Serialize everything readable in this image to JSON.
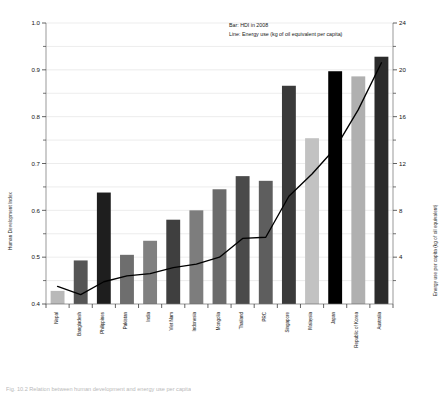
{
  "legend": {
    "bar_entry": "Bar:   HDI in 2008",
    "line_entry": "Line:  Energy use (kg of oil equivalent per capita)"
  },
  "axes": {
    "left_title": "Human Development Index",
    "right_title": "Energy use per capita (kg of oil equivalent)",
    "left_ticks": [
      "1.0",
      "0.9",
      "0.8",
      "0.7",
      "0.6",
      "0.5",
      "0.4"
    ],
    "right_ticks": [
      "24",
      "20",
      "16",
      "12",
      "8",
      "4"
    ]
  },
  "caption": {
    "text": "Fig. 10.2  Relation between human development and energy use per capita"
  },
  "chart_data": {
    "type": "bar",
    "title": "",
    "xlabel": "",
    "ylabel": "Human Development Index",
    "ylim": [
      0.4,
      1.0
    ],
    "y2label": "Energy use per capita (kg of oil equivalent)",
    "y2lim": [
      0,
      24
    ],
    "grid": true,
    "legend_position": "top-center",
    "categories": [
      "Nepal",
      "Bangladesh",
      "Philippines",
      "Pakistan",
      "India",
      "Viet Nam",
      "Indonesia",
      "Mongolia",
      "Thailand",
      "PRC",
      "Singapore",
      "Malaysia",
      "Japan",
      "Republic of Korea",
      "Australia"
    ],
    "series": [
      {
        "name": "Bar: HDI in 2008",
        "axis": "left",
        "values": [
          0.428,
          0.493,
          0.638,
          0.505,
          0.535,
          0.58,
          0.6,
          0.645,
          0.673,
          0.663,
          0.866,
          0.754,
          0.897,
          0.886,
          0.928
        ],
        "colors": [
          "#b9b9b9",
          "#555555",
          "#1e1e1e",
          "#6e6e6e",
          "#808080",
          "#3f3f3f",
          "#7d7d7d",
          "#6b6b6b",
          "#4a4a4a",
          "#5e5e5e",
          "#3a3a3a",
          "#c2c2c2",
          "#000000",
          "#b0b0b0",
          "#2b2b2b"
        ]
      },
      {
        "name": "Line: Energy use (kg of oil equivalent per capita)",
        "axis": "right",
        "values": [
          1.5,
          0.8,
          1.9,
          2.4,
          2.6,
          3.1,
          3.4,
          4.0,
          5.6,
          5.7,
          9.2,
          11.1,
          13.3,
          16.6,
          20.6
        ]
      }
    ]
  }
}
